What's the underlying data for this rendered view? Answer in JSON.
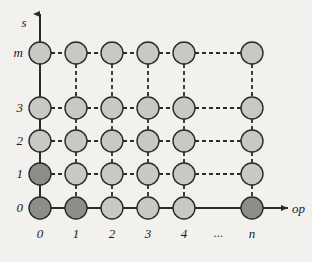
{
  "figure": {
    "background_color": "#f2f1ee",
    "axes": {
      "y_axis": {
        "name": "vertical-axis",
        "label": "s",
        "label_style": "italic",
        "arrow": "up",
        "tick_labels": [
          "0",
          "1",
          "2",
          "3",
          "m"
        ]
      },
      "x_axis": {
        "name": "horizontal-axis",
        "label": "op",
        "label_style": "italic",
        "arrow": "right",
        "tick_labels": [
          "0",
          "1",
          "2",
          "3",
          "4",
          "...",
          "n"
        ]
      }
    },
    "colors": {
      "node_normal_fill": "#c9c8c4",
      "node_highlight_fill": "#8d8d8a",
      "node_stroke": "#2b2b2b",
      "edge_solid": "#2b2b2b",
      "edge_dashed": "#2b2b2b",
      "text": "#1a1a1a"
    },
    "node_radius": 11,
    "columns": [
      {
        "key": "c0",
        "label": "0",
        "x": 40
      },
      {
        "key": "c1",
        "label": "1",
        "x": 76
      },
      {
        "key": "c2",
        "label": "2",
        "x": 112
      },
      {
        "key": "c3",
        "label": "3",
        "x": 148
      },
      {
        "key": "c4",
        "label": "4",
        "x": 184
      },
      {
        "key": "cn",
        "label": "n",
        "x": 252
      }
    ],
    "gap_label": {
      "label": "...",
      "x": 218
    },
    "rows": [
      {
        "key": "rm",
        "label": "m",
        "y": 53
      },
      {
        "key": "r3",
        "label": "3",
        "y": 108
      },
      {
        "key": "r2",
        "label": "2",
        "y": 141
      },
      {
        "key": "r1",
        "label": "1",
        "y": 174
      },
      {
        "key": "r0",
        "label": "0",
        "y": 208
      }
    ],
    "nodes": [
      {
        "name": "node-op0-s-m",
        "col": 0,
        "row": 0,
        "state": "normal"
      },
      {
        "name": "node-op1-s-m",
        "col": 1,
        "row": 0,
        "state": "normal"
      },
      {
        "name": "node-op2-s-m",
        "col": 2,
        "row": 0,
        "state": "normal"
      },
      {
        "name": "node-op3-s-m",
        "col": 3,
        "row": 0,
        "state": "normal"
      },
      {
        "name": "node-op4-s-m",
        "col": 4,
        "row": 0,
        "state": "normal"
      },
      {
        "name": "node-opn-s-m",
        "col": 5,
        "row": 0,
        "state": "normal"
      },
      {
        "name": "node-op0-s3",
        "col": 0,
        "row": 1,
        "state": "normal"
      },
      {
        "name": "node-op1-s3",
        "col": 1,
        "row": 1,
        "state": "normal"
      },
      {
        "name": "node-op2-s3",
        "col": 2,
        "row": 1,
        "state": "normal"
      },
      {
        "name": "node-op3-s3",
        "col": 3,
        "row": 1,
        "state": "normal"
      },
      {
        "name": "node-op4-s3",
        "col": 4,
        "row": 1,
        "state": "normal"
      },
      {
        "name": "node-opn-s3",
        "col": 5,
        "row": 1,
        "state": "normal"
      },
      {
        "name": "node-op0-s2",
        "col": 0,
        "row": 2,
        "state": "normal"
      },
      {
        "name": "node-op1-s2",
        "col": 1,
        "row": 2,
        "state": "normal"
      },
      {
        "name": "node-op2-s2",
        "col": 2,
        "row": 2,
        "state": "normal"
      },
      {
        "name": "node-op3-s2",
        "col": 3,
        "row": 2,
        "state": "normal"
      },
      {
        "name": "node-op4-s2",
        "col": 4,
        "row": 2,
        "state": "normal"
      },
      {
        "name": "node-opn-s2",
        "col": 5,
        "row": 2,
        "state": "normal"
      },
      {
        "name": "node-op0-s1",
        "col": 0,
        "row": 3,
        "state": "highlight"
      },
      {
        "name": "node-op1-s1",
        "col": 1,
        "row": 3,
        "state": "normal"
      },
      {
        "name": "node-op2-s1",
        "col": 2,
        "row": 3,
        "state": "normal"
      },
      {
        "name": "node-op3-s1",
        "col": 3,
        "row": 3,
        "state": "normal"
      },
      {
        "name": "node-op4-s1",
        "col": 4,
        "row": 3,
        "state": "normal"
      },
      {
        "name": "node-opn-s1",
        "col": 5,
        "row": 3,
        "state": "normal"
      },
      {
        "name": "node-op0-s0",
        "col": 0,
        "row": 4,
        "state": "highlight"
      },
      {
        "name": "node-op1-s0",
        "col": 1,
        "row": 4,
        "state": "highlight"
      },
      {
        "name": "node-op2-s0",
        "col": 2,
        "row": 4,
        "state": "normal"
      },
      {
        "name": "node-op3-s0",
        "col": 3,
        "row": 4,
        "state": "normal"
      },
      {
        "name": "node-op4-s0",
        "col": 4,
        "row": 4,
        "state": "normal"
      },
      {
        "name": "node-opn-s0",
        "col": 5,
        "row": 4,
        "state": "highlight"
      }
    ],
    "edges": {
      "horizontal": [
        {
          "row": 0,
          "from": 0,
          "to": 1,
          "style": "dashed"
        },
        {
          "row": 0,
          "from": 1,
          "to": 2,
          "style": "dashed"
        },
        {
          "row": 0,
          "from": 2,
          "to": 3,
          "style": "dashed"
        },
        {
          "row": 0,
          "from": 3,
          "to": 4,
          "style": "dashed"
        },
        {
          "row": 0,
          "from": 4,
          "to": 5,
          "style": "dashed"
        },
        {
          "row": 1,
          "from": 0,
          "to": 1,
          "style": "dashed"
        },
        {
          "row": 1,
          "from": 1,
          "to": 2,
          "style": "dashed"
        },
        {
          "row": 1,
          "from": 2,
          "to": 3,
          "style": "dashed"
        },
        {
          "row": 1,
          "from": 3,
          "to": 4,
          "style": "dashed"
        },
        {
          "row": 1,
          "from": 4,
          "to": 5,
          "style": "dashed"
        },
        {
          "row": 2,
          "from": 0,
          "to": 1,
          "style": "dashed"
        },
        {
          "row": 2,
          "from": 1,
          "to": 2,
          "style": "dashed"
        },
        {
          "row": 2,
          "from": 2,
          "to": 3,
          "style": "dashed"
        },
        {
          "row": 2,
          "from": 3,
          "to": 4,
          "style": "dashed"
        },
        {
          "row": 2,
          "from": 4,
          "to": 5,
          "style": "dashed"
        },
        {
          "row": 3,
          "from": 0,
          "to": 1,
          "style": "dashed"
        },
        {
          "row": 3,
          "from": 1,
          "to": 2,
          "style": "dashed"
        },
        {
          "row": 3,
          "from": 2,
          "to": 3,
          "style": "dashed"
        },
        {
          "row": 3,
          "from": 3,
          "to": 4,
          "style": "dashed"
        },
        {
          "row": 3,
          "from": 4,
          "to": 5,
          "style": "dashed"
        },
        {
          "row": 4,
          "from": 0,
          "to": 1,
          "style": "solid"
        },
        {
          "row": 4,
          "from": 1,
          "to": 2,
          "style": "solid"
        },
        {
          "row": 4,
          "from": 2,
          "to": 3,
          "style": "solid"
        },
        {
          "row": 4,
          "from": 3,
          "to": 4,
          "style": "solid"
        },
        {
          "row": 4,
          "from": 4,
          "to": 5,
          "style": "solid"
        }
      ],
      "vertical": [
        {
          "col": 0,
          "from": 0,
          "to": 1,
          "style": "solid"
        },
        {
          "col": 0,
          "from": 1,
          "to": 2,
          "style": "solid"
        },
        {
          "col": 0,
          "from": 2,
          "to": 3,
          "style": "solid"
        },
        {
          "col": 0,
          "from": 3,
          "to": 4,
          "style": "solid"
        },
        {
          "col": 1,
          "from": 0,
          "to": 1,
          "style": "dashed"
        },
        {
          "col": 1,
          "from": 1,
          "to": 2,
          "style": "dashed"
        },
        {
          "col": 1,
          "from": 2,
          "to": 3,
          "style": "dashed"
        },
        {
          "col": 1,
          "from": 3,
          "to": 4,
          "style": "dashed"
        },
        {
          "col": 2,
          "from": 0,
          "to": 1,
          "style": "dashed"
        },
        {
          "col": 2,
          "from": 1,
          "to": 2,
          "style": "dashed"
        },
        {
          "col": 2,
          "from": 2,
          "to": 3,
          "style": "dashed"
        },
        {
          "col": 2,
          "from": 3,
          "to": 4,
          "style": "dashed"
        },
        {
          "col": 3,
          "from": 0,
          "to": 1,
          "style": "dashed"
        },
        {
          "col": 3,
          "from": 1,
          "to": 2,
          "style": "dashed"
        },
        {
          "col": 3,
          "from": 2,
          "to": 3,
          "style": "dashed"
        },
        {
          "col": 3,
          "from": 3,
          "to": 4,
          "style": "dashed"
        },
        {
          "col": 4,
          "from": 0,
          "to": 1,
          "style": "dashed"
        },
        {
          "col": 4,
          "from": 1,
          "to": 2,
          "style": "dashed"
        },
        {
          "col": 4,
          "from": 2,
          "to": 3,
          "style": "dashed"
        },
        {
          "col": 4,
          "from": 3,
          "to": 4,
          "style": "dashed"
        },
        {
          "col": 5,
          "from": 0,
          "to": 1,
          "style": "dashed"
        },
        {
          "col": 5,
          "from": 1,
          "to": 2,
          "style": "dashed"
        },
        {
          "col": 5,
          "from": 2,
          "to": 3,
          "style": "dashed"
        },
        {
          "col": 5,
          "from": 3,
          "to": 4,
          "style": "dashed"
        }
      ]
    },
    "axis_geometry": {
      "y_axis_x": 40,
      "y_axis_top": 14,
      "y_axis_bottom": 208,
      "x_axis_y": 208,
      "x_axis_left": 40,
      "x_axis_right": 288,
      "y_label_pos": {
        "x": 24,
        "y": 27
      },
      "x_label_pos": {
        "x": 292,
        "y": 213
      }
    }
  }
}
